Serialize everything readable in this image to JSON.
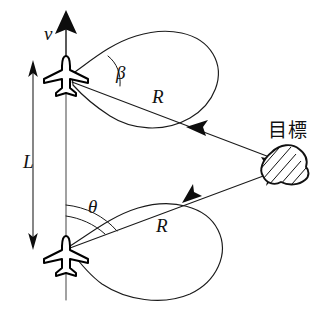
{
  "figure": {
    "background_color": "#ffffff",
    "ink_color": "#111111",
    "labels": {
      "velocity": "v",
      "baseline": "L",
      "angle_beta": "β",
      "angle_theta": "θ",
      "radius_upper": "R",
      "radius_lower": "R",
      "target": "目標"
    },
    "elements": {
      "aircraft_upper_name": "aircraft-upper",
      "aircraft_lower_name": "aircraft-lower",
      "target_name": "target-object",
      "loop_upper_name": "orbit-loop-upper",
      "loop_lower_name": "orbit-loop-lower",
      "baseline_name": "baseline-axis",
      "velocity_arrow_name": "velocity-arrow",
      "sightline_upper_name": "sight-line-upper",
      "sightline_lower_name": "sight-line-lower"
    }
  }
}
